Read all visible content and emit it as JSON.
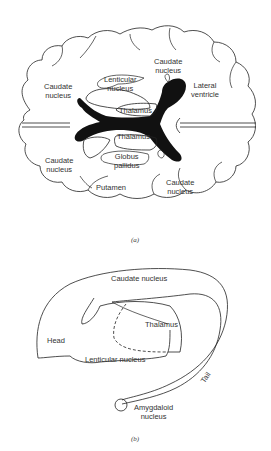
{
  "figure_a": {
    "caption": "(a)",
    "labels": {
      "caudate_top": [
        "Caudate",
        "nucleus"
      ],
      "caudate_left": [
        "Caudate",
        "nucleus"
      ],
      "lenticular": [
        "Lenticular",
        "nucleus"
      ],
      "lateral_ventricle": [
        "Lateral",
        "ventricle"
      ],
      "thalamus_upper": "Thalamus",
      "thalamus_lower": "Thalamus",
      "caudate_lower_left": [
        "Caudate",
        "nucleus"
      ],
      "globus_pallidus": [
        "Globus",
        "pallidus"
      ],
      "putamen": "Putamen",
      "caudate_lower_right": [
        "Caudate",
        "nucleus"
      ]
    }
  },
  "figure_b": {
    "caption": "(b)",
    "labels": {
      "caudate": "Caudate nucleus",
      "thalamus": "Thalamus",
      "head": "Head",
      "lenticular": "Lenticular nucleus",
      "tail": "Tail",
      "amygdaloid": [
        "Amygdaloid",
        "nucleus"
      ]
    }
  },
  "colors": {
    "line": "#222222",
    "ventricle": "#111111",
    "text": "#333333"
  }
}
